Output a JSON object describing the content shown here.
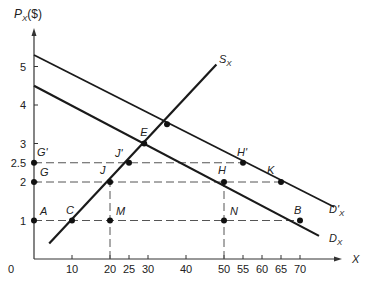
{
  "chart_data": {
    "type": "line",
    "title": "",
    "xlabel": "X",
    "ylabel": "P_X ($)",
    "xlim": [
      0,
      78
    ],
    "ylim": [
      0,
      5.8
    ],
    "grid": false,
    "x_ticks": [
      0,
      10,
      20,
      25,
      30,
      40,
      50,
      55,
      60,
      65,
      70
    ],
    "y_ticks": [
      1,
      2,
      2.5,
      3,
      4,
      5
    ],
    "series": [
      {
        "name": "D_X",
        "label": "D",
        "sub": "X",
        "type": "line",
        "points": [
          [
            0,
            4.5
          ],
          [
            75,
            0.6
          ]
        ]
      },
      {
        "name": "D'_X",
        "label": "D'",
        "sub": "X",
        "type": "line",
        "points": [
          [
            0,
            5.3
          ],
          [
            79,
            1.35
          ]
        ]
      },
      {
        "name": "S_X",
        "label": "S",
        "sub": "X",
        "type": "line",
        "points": [
          [
            4,
            0.4
          ],
          [
            48,
            5.05
          ]
        ]
      }
    ],
    "points": [
      {
        "label": "A",
        "x": 0,
        "y": 1
      },
      {
        "label": "C",
        "x": 10,
        "y": 1
      },
      {
        "label": "M",
        "x": 20,
        "y": 1
      },
      {
        "label": "N",
        "x": 50,
        "y": 1
      },
      {
        "label": "B",
        "x": 70,
        "y": 1
      },
      {
        "label": "G",
        "x": 0,
        "y": 2
      },
      {
        "label": "J",
        "x": 20,
        "y": 2
      },
      {
        "label": "H",
        "x": 50,
        "y": 2
      },
      {
        "label": "K",
        "x": 65,
        "y": 2
      },
      {
        "label": "G'",
        "x": 0,
        "y": 2.5
      },
      {
        "label": "J'",
        "x": 25,
        "y": 2.5
      },
      {
        "label": "H'",
        "x": 55,
        "y": 2.5
      },
      {
        "label": "E",
        "x": 29,
        "y": 3
      },
      {
        "label": "",
        "x": 35,
        "y": 3.5
      }
    ],
    "dashed_lines": [
      {
        "from": [
          0,
          1
        ],
        "to": [
          70,
          1
        ]
      },
      {
        "from": [
          0,
          2
        ],
        "to": [
          65,
          2
        ]
      },
      {
        "from": [
          0,
          2.5
        ],
        "to": [
          55,
          2.5
        ]
      },
      {
        "from": [
          20,
          0
        ],
        "to": [
          20,
          2
        ]
      },
      {
        "from": [
          50,
          0
        ],
        "to": [
          50,
          2
        ]
      }
    ],
    "legend": "none"
  },
  "labels": {
    "y_axis_main": "P",
    "y_axis_sub": "X",
    "y_axis_unit": "($)",
    "x_axis": "X",
    "origin": "0",
    "supply_main": "S",
    "supply_sub": "X",
    "demand_main": "D",
    "demand_sub": "X",
    "demand2_main": "D'",
    "demand2_sub": "X"
  }
}
